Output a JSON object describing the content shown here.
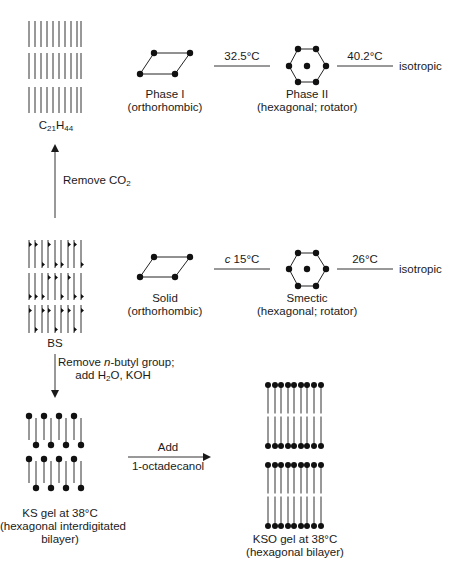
{
  "top_row": {
    "molecule": {
      "name_main": "C",
      "sub1": "21",
      "name_mid": "H",
      "sub2": "44"
    },
    "phase1": {
      "title": "Phase I",
      "subtitle": "(orthorhombic)"
    },
    "transition1": "32.5°C",
    "phase2": {
      "title": "Phase II",
      "subtitle": "(hexagonal; rotator)"
    },
    "transition2": "40.2°C",
    "end_state": "isotropic"
  },
  "arrow_up": {
    "label_main": "Remove CO",
    "label_sub": "2"
  },
  "middle_row": {
    "molecule": {
      "name": "BS"
    },
    "phase1": {
      "title": "Solid",
      "subtitle": "(orthorhombic)"
    },
    "transition1_prefix": "c",
    "transition1": " 15°C",
    "phase2": {
      "title": "Smectic",
      "subtitle": "(hexagonal; rotator)"
    },
    "transition2": "26°C",
    "end_state": "isotropic"
  },
  "arrow_down": {
    "line1_a": "Remove ",
    "line1_italic": "n",
    "line1_b": "-butyl group;",
    "line2_a": "add H",
    "line2_sub": "2",
    "line2_b": "O, KOH"
  },
  "bottom_row": {
    "ks_gel": {
      "line1": "KS gel at 38°C",
      "line2": "(hexagonal interdigitated",
      "line3": "bilayer)"
    },
    "arrow_right": {
      "label_top": "Add",
      "label_bottom": "1-octadecanol"
    },
    "kso_gel": {
      "line1": "KSO gel at 38°C",
      "line2": "(hexagonal bilayer)"
    }
  }
}
